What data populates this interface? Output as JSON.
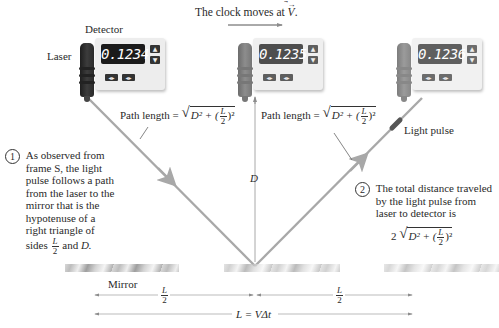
{
  "title": "The clock moves at",
  "title_vector": "V",
  "colors": {
    "light_path": "#a8a8a8",
    "laser_body_left": "#3a3a3a",
    "laser_body_mid": "#8a8a8a",
    "laser_body_right": "#a0a0a0",
    "panel": "#ececec",
    "display_bg_left": "#2c2c2c",
    "display_bg_mid": "#555555",
    "display_bg_right": "#6a6a6a",
    "display_text": "#ffffff",
    "light_pulse": "#555555",
    "arrow_gray": "#8c8c8c"
  },
  "devices": [
    {
      "position": "left",
      "reading": "0.1234",
      "detector_label": "Detector",
      "laser_label": "Laser"
    },
    {
      "position": "middle",
      "reading": "0.1235"
    },
    {
      "position": "right",
      "reading": "0.1236"
    }
  ],
  "labels": {
    "path_length_prefix": "Path length =",
    "D": "D",
    "light_pulse": "Light pulse",
    "mirror": "Mirror",
    "L": "L",
    "two": "2",
    "L_equals": "L = VΔt",
    "formula_inner": "D² + (",
    "formula_outer_close": ")²",
    "total_prefix": "2"
  },
  "annotations": {
    "note1": {
      "number": "1",
      "lines": [
        "As observed from",
        "frame S, the light",
        "pulse follows a path",
        "from the laser to the",
        "mirror that is the",
        "hypotenuse of a",
        "right triangle of"
      ],
      "last_prefix": "sides",
      "last_suffix": "and",
      "last_D": "D."
    },
    "note2": {
      "number": "2",
      "lines": [
        "The total distance traveled",
        "by the light pulse from",
        "laser to detector is"
      ]
    }
  }
}
